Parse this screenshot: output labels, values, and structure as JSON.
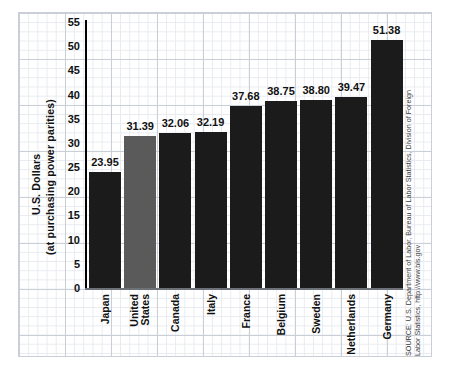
{
  "chart_data": {
    "type": "bar",
    "title": "",
    "xlabel": "",
    "ylabel": "U.S. Dollars",
    "ylabel_sub": "(at purchasing power parities)",
    "ylim": [
      0,
      55
    ],
    "ytick_step": 5,
    "yticks": [
      "55",
      "50",
      "45",
      "40",
      "35",
      "30",
      "25",
      "20",
      "15",
      "10",
      "5",
      "0"
    ],
    "grid": true,
    "legend": "none",
    "categories": [
      "Japan",
      "United States",
      "Canada",
      "Italy",
      "France",
      "Belgium",
      "Sweden",
      "Netherlands",
      "Germany"
    ],
    "values": [
      23.95,
      31.39,
      32.06,
      32.19,
      37.68,
      38.75,
      38.8,
      39.47,
      51.38
    ],
    "value_labels": [
      "23.95",
      "31.39",
      "32.06",
      "32.19",
      "37.68",
      "38.75",
      "38.80",
      "39.47",
      "51.38"
    ],
    "bars": [
      {
        "category": "Japan",
        "label_lines": [
          "Japan"
        ],
        "value": 23.95,
        "value_label": "23.95",
        "color": "#1b1b1b",
        "highlight": false
      },
      {
        "category": "United States",
        "label_lines": [
          "United",
          "States"
        ],
        "value": 31.39,
        "value_label": "31.39",
        "color": "#5a5a5a",
        "highlight": true
      },
      {
        "category": "Canada",
        "label_lines": [
          "Canada"
        ],
        "value": 32.06,
        "value_label": "32.06",
        "color": "#1b1b1b",
        "highlight": false
      },
      {
        "category": "Italy",
        "label_lines": [
          "Italy"
        ],
        "value": 32.19,
        "value_label": "32.19",
        "color": "#1b1b1b",
        "highlight": false
      },
      {
        "category": "France",
        "label_lines": [
          "France"
        ],
        "value": 37.68,
        "value_label": "37.68",
        "color": "#1b1b1b",
        "highlight": false
      },
      {
        "category": "Belgium",
        "label_lines": [
          "Belgium"
        ],
        "value": 38.75,
        "value_label": "38.75",
        "color": "#1b1b1b",
        "highlight": false
      },
      {
        "category": "Sweden",
        "label_lines": [
          "Sweden"
        ],
        "value": 38.8,
        "value_label": "38.80",
        "color": "#1b1b1b",
        "highlight": false
      },
      {
        "category": "Netherlands",
        "label_lines": [
          "Netherlands"
        ],
        "value": 39.47,
        "value_label": "39.47",
        "color": "#1b1b1b",
        "highlight": false
      },
      {
        "category": "Germany",
        "label_lines": [
          "Germany"
        ],
        "value": 51.38,
        "value_label": "51.38",
        "color": "#1b1b1b",
        "highlight": false
      }
    ],
    "colors": {
      "bar_default": "#1b1b1b",
      "bar_highlight": "#5a5a5a",
      "axis": "#000000",
      "grid_major": "#c9ced7",
      "grid_minor": "#e7eaef",
      "text": "#111111",
      "background": "#ffffff"
    }
  },
  "source": {
    "text": "SOURCE: U.S. Department of Labor, Bureau of Labor Statistics, Division of Foreign Labor Statistics, http://www.bls.gov"
  }
}
